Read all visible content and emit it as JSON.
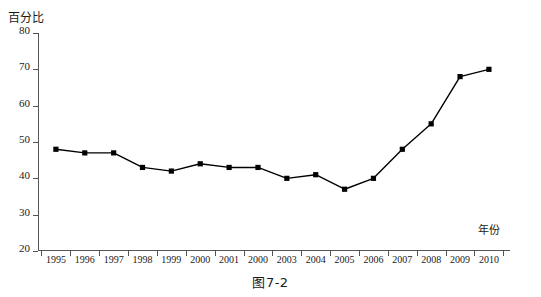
{
  "figure": {
    "caption": "图7-2",
    "top_remnant": "· · · · · · · · ·"
  },
  "chart_data": {
    "type": "line",
    "title": "",
    "subtitle": "",
    "xlabel": "年份",
    "ylabel": "百分比",
    "ylim": [
      20,
      80
    ],
    "ytick_values": [
      80,
      70,
      60,
      50,
      40,
      30,
      20
    ],
    "ytick_labels": [
      "80",
      "70",
      "60",
      "50",
      "40",
      "30",
      "20"
    ],
    "grid": false,
    "legend": null,
    "marker": "square",
    "line_color": "#000000",
    "marker_color": "#000000",
    "categories": [
      "1995",
      "1996",
      "1997",
      "1998",
      "1999",
      "2000",
      "2001",
      "2000",
      "2003",
      "2004",
      "2005",
      "2006",
      "2007",
      "2008",
      "2009",
      "2010"
    ],
    "values": [
      48,
      47,
      47,
      43,
      42,
      44,
      43,
      43,
      40,
      41,
      37,
      40,
      48,
      55,
      68,
      70
    ],
    "annotations": []
  }
}
